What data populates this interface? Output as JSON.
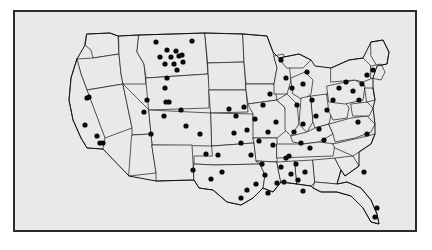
{
  "figure": {
    "kind": "dot-distribution-map",
    "region": "Contiguous United States",
    "background_color": "#ffffff",
    "panel_color": "#e9e9e9",
    "frame_color": "#2b2b2b",
    "boundary_color": "#1a1a1a",
    "dot_color": "#0a0a0a",
    "title": "",
    "caption": "",
    "legend": [],
    "axis_labels": []
  },
  "chart_data": {
    "type": "scatter",
    "title": "",
    "xlabel": "",
    "ylabel": "",
    "grid": false,
    "legend_position": "none",
    "xlim": [
      0,
      400
    ],
    "ylim": [
      0,
      218
    ],
    "marker": "filled-circle",
    "marker_radius": 2.6,
    "point_count": 92,
    "points": [
      [
        141,
        30
      ],
      [
        177,
        29
      ],
      [
        152,
        38
      ],
      [
        161,
        39
      ],
      [
        145,
        45
      ],
      [
        156,
        45
      ],
      [
        164,
        44
      ],
      [
        167,
        43
      ],
      [
        150,
        52
      ],
      [
        159,
        52
      ],
      [
        168,
        50
      ],
      [
        162,
        58
      ],
      [
        152,
        66
      ],
      [
        150,
        76
      ],
      [
        132,
        88
      ],
      [
        151,
        90
      ],
      [
        154,
        90
      ],
      [
        149,
        104
      ],
      [
        72,
        86
      ],
      [
        74,
        85
      ],
      [
        70,
        113
      ],
      [
        82,
        124
      ],
      [
        85,
        131
      ],
      [
        88,
        131
      ],
      [
        129,
        100
      ],
      [
        136,
        122
      ],
      [
        166,
        98
      ],
      [
        171,
        114
      ],
      [
        185,
        122
      ],
      [
        191,
        142
      ],
      [
        203,
        143
      ],
      [
        207,
        160
      ],
      [
        178,
        158
      ],
      [
        196,
        167
      ],
      [
        214,
        97
      ],
      [
        219,
        121
      ],
      [
        221,
        104
      ],
      [
        226,
        131
      ],
      [
        229,
        95
      ],
      [
        232,
        118
      ],
      [
        236,
        143
      ],
      [
        240,
        107
      ],
      [
        244,
        129
      ],
      [
        247,
        152
      ],
      [
        250,
        163
      ],
      [
        241,
        172
      ],
      [
        232,
        178
      ],
      [
        226,
        186
      ],
      [
        253,
        181
      ],
      [
        262,
        171
      ],
      [
        266,
        155
      ],
      [
        271,
        146
      ],
      [
        258,
        133
      ],
      [
        253,
        120
      ],
      [
        261,
        110
      ],
      [
        248,
        93
      ],
      [
        255,
        82
      ],
      [
        266,
        48
      ],
      [
        271,
        66
      ],
      [
        277,
        76
      ],
      [
        282,
        93
      ],
      [
        288,
        72
      ],
      [
        292,
        60
      ],
      [
        297,
        88
      ],
      [
        301,
        104
      ],
      [
        288,
        112
      ],
      [
        279,
        120
      ],
      [
        286,
        131
      ],
      [
        295,
        136
      ],
      [
        274,
        144
      ],
      [
        281,
        152
      ],
      [
        290,
        160
      ],
      [
        276,
        162
      ],
      [
        283,
        168
      ],
      [
        269,
        170
      ],
      [
        288,
        179
      ],
      [
        304,
        117
      ],
      [
        309,
        128
      ],
      [
        312,
        98
      ],
      [
        318,
        88
      ],
      [
        324,
        76
      ],
      [
        331,
        70
      ],
      [
        338,
        79
      ],
      [
        344,
        88
      ],
      [
        347,
        72
      ],
      [
        352,
        63
      ],
      [
        358,
        58
      ],
      [
        343,
        110
      ],
      [
        352,
        122
      ],
      [
        349,
        160
      ],
      [
        362,
        196
      ],
      [
        360,
        205
      ]
    ]
  }
}
